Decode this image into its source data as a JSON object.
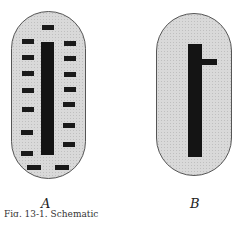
{
  "figure": {
    "panels": [
      {
        "label": "A",
        "description": "cell with central chromatin bar and scattered fragments"
      },
      {
        "label": "B",
        "description": "cell with central chromatin bar and one side branch"
      }
    ],
    "caption": "Fig. 13-1.  Schematic"
  }
}
